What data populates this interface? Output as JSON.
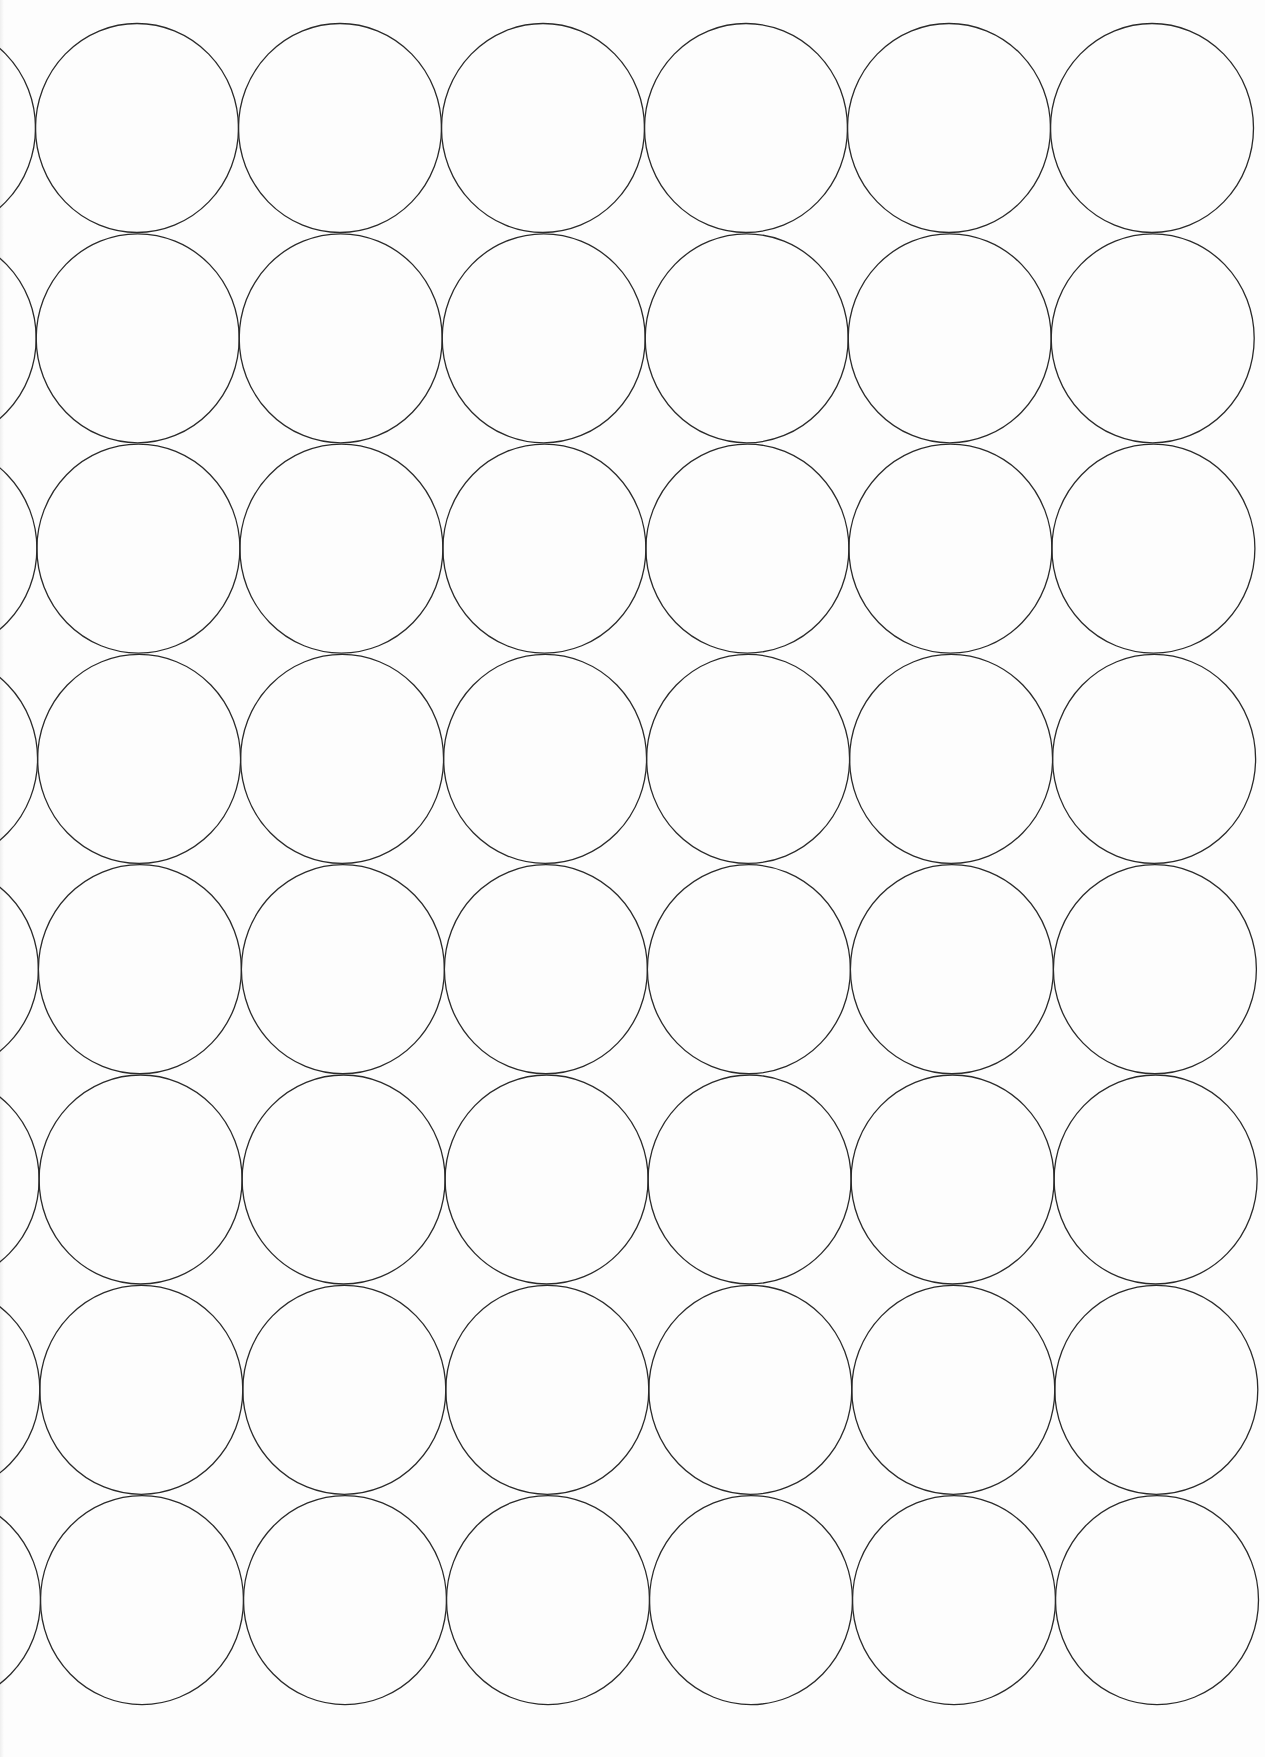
{
  "page": {
    "background_color": "#fdfdfd",
    "stroke_color": "#2a2a2a"
  },
  "grid": {
    "rows": 8,
    "full_columns": 6,
    "partial_left_column": true,
    "circle_width": 203,
    "circle_height": 209,
    "column_spacing": 203,
    "row_spacing": 210.3,
    "first_row_center_y": 128,
    "first_col_center_x_top": 137,
    "first_col_center_x_bottom": 142,
    "stroke_width": 1.3
  }
}
